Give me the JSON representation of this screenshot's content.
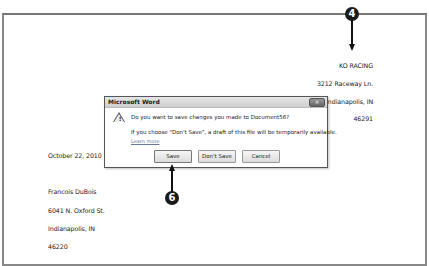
{
  "document": {
    "sender": {
      "company": "KO RACING",
      "street": "3212 Raceway Ln.",
      "city_state": "Indianapolis, IN",
      "zip": "46291"
    },
    "date": "October 22, 2010",
    "recipient": {
      "name": "Francois DuBois",
      "street": "6041 N. Oxford St.",
      "city_state": "Indianapolis, IN",
      "zip": "46220"
    }
  },
  "dialog": {
    "title": "Microsoft Word",
    "close_label": "✕",
    "message": "Do you want to save changes you made to Document56?",
    "detail": "If you choose \"Don't Save\", a draft of this file will be temporarily available.",
    "learn_more": "Learn more",
    "buttons": {
      "save": "Save",
      "dont_save": "Don't Save",
      "cancel": "Cancel"
    },
    "icon": "warning-icon"
  },
  "callouts": {
    "step4": "4",
    "step6": "6"
  }
}
